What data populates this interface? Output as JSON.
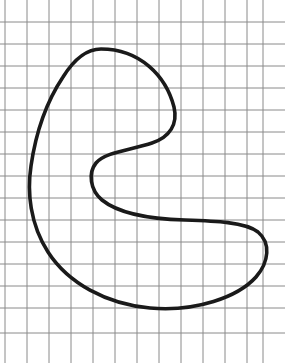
{
  "figure": {
    "background_color": "#ffffff",
    "width": 285,
    "height": 363,
    "grid": {
      "name": "graph-paper-grid",
      "line_color": "#8a8a8a",
      "line_width": 1,
      "cell_size": 22.0,
      "origin_x": 5,
      "origin_y": 0,
      "vertical_line_x": [
        5,
        27,
        49,
        71,
        93,
        115,
        137,
        159,
        181,
        203,
        225,
        247,
        263
      ],
      "horizontal_line_y": [
        22,
        44,
        66,
        88,
        110,
        132,
        154,
        176,
        198,
        220,
        242,
        264,
        286,
        308,
        333
      ],
      "columns": 12,
      "rows": 15
    },
    "curve": {
      "name": "bean-curve",
      "stroke_color": "#1a1a1a",
      "stroke_width": 3.6,
      "fill": "none",
      "closed": true,
      "key_points": {
        "top_apex": [
          101,
          49
        ],
        "left_extreme": [
          31,
          170
        ],
        "bottom_apex": [
          146,
          307
        ],
        "right_extreme": [
          268,
          241
        ],
        "notch_outer_right": [
          172,
          116
        ],
        "notch_inner_left": [
          93,
          180
        ],
        "notch_lower_right": [
          210,
          219
        ]
      },
      "path": "M 101 49 C 140 49 166 76 174 107 C 178 124 170 137 152 143 C 131 150 105 152 96 163 C 88 173 90 190 102 200 C 118 213 150 219 185 220 C 215 221 245 222 258 232 C 271 243 269 262 256 277 C 238 297 196 312 150 308 C 106 304 68 283 48 252 C 30 224 27 192 31 166 C 36 131 47 101 63 77 C 73 61 85 49 101 49 Z"
    }
  }
}
